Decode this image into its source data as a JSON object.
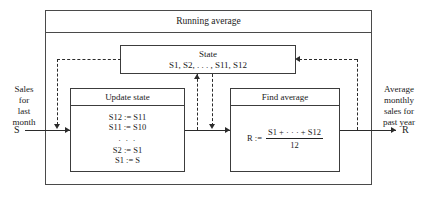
{
  "diagram": {
    "title": "Running average",
    "outer_box_label": "Running average",
    "state": {
      "title": "State",
      "contents": "S1, S2, . . . , S11, S12"
    },
    "update": {
      "title": "Update state",
      "lines": [
        "S12 := S11",
        "S11 := S10",
        ". . .",
        "S2 := S1",
        "S1 := S"
      ]
    },
    "find": {
      "title": "Find average",
      "assign": "R :=",
      "numerator": "S1 + · · · + S12",
      "denominator": "12"
    },
    "input": {
      "caption_line1": "Sales",
      "caption_line2": "for",
      "caption_line3": "last",
      "caption_line4": "month",
      "symbol": "S"
    },
    "output": {
      "caption_line1": "Average",
      "caption_line2": "monthly",
      "caption_line3": "sales for",
      "caption_line4": "past year",
      "symbol": "R"
    },
    "colors": {
      "line": "#2b2b2b",
      "box_border": "#3c3c3c",
      "outer_border": "#4a4a4a",
      "background": "#ffffff",
      "text": "#1b1b1b"
    }
  }
}
